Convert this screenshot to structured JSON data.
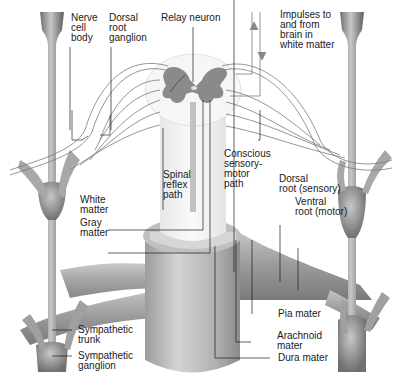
{
  "figure": {
    "colors": {
      "background": "#ffffff",
      "gray_matter": "#8a8a8a",
      "white_matter": "#f2f2f2",
      "cord_shading": "#b8b8b8",
      "nerve_shading": "#9a9a9a",
      "leader_line": "#1a1a1a",
      "fiber_line": "#555555"
    }
  },
  "labels": {
    "nerve_cell_body": "Nerve\ncell\nbody",
    "dorsal_root_ganglion": "Dorsal\nroot\nganglion",
    "relay_neuron": "Relay neuron",
    "impulses_to_from_brain": "Impulses to\nand from\nbrain in\nwhite matter",
    "spinal_reflex_path": "Spinal\nreflex\npath",
    "conscious_sensory_motor_path": "Conscious\nsensory-\nmotor\npath",
    "white_matter": "White\nmatter",
    "gray_matter": "Gray\nmatter",
    "dorsal_root": "Dorsal\nroot (sensory)",
    "ventral_root": "Ventral\nroot (motor)",
    "sympathetic_trunk": "Sympathetic\ntrunk",
    "sympathetic_ganglion": "Sympathetic\nganglion",
    "pia_mater": "Pia mater",
    "arachnoid_mater": "Arachnoid\nmater",
    "dura_mater": "Dura mater"
  }
}
